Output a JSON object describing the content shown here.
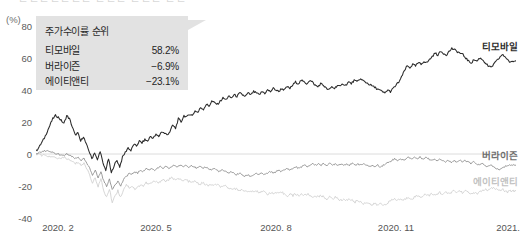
{
  "header": {
    "cropped_text": "ㄴㄴㄴㄴㄴㄴㄴ ㄴㄴㄴ ㄴㄴㄴ ㄴㄴ"
  },
  "axes": {
    "unit_label": "(%)",
    "y_ticks": [
      80,
      60,
      40,
      20,
      0,
      -20,
      -40
    ],
    "y_tick_labels": [
      "80",
      "60",
      "40",
      "20",
      "0",
      "-20",
      "-40"
    ],
    "x_tick_labels": [
      "2020. 2",
      "2020. 5",
      "2020. 8",
      "2020. 11",
      "2021. 2"
    ],
    "ylim": [
      -40,
      80
    ],
    "grid": "zero-line-only"
  },
  "legend": {
    "title": "주가수이률 순위",
    "rows": [
      {
        "name": "티모바일",
        "value": "58.2%"
      },
      {
        "name": "버라이즌",
        "value": "−6.9%"
      },
      {
        "name": "에이티앤티",
        "value": "−23.1%"
      }
    ]
  },
  "series_labels": [
    {
      "text": "티모바일",
      "color": "#2b2b2b"
    },
    {
      "text": "버라이즌",
      "color": "#6d6d6d"
    },
    {
      "text": "에이티앤티",
      "color": "#c2c2c2"
    }
  ],
  "colors": {
    "tmobile": "#2b2b2b",
    "verizon": "#8a8a8a",
    "att": "#cfcfcf",
    "zero_line": "#dcdcdc",
    "legend_bg": "#e2e2e2"
  },
  "chart_data": {
    "type": "line",
    "title": "",
    "subtitle": "",
    "xlabel": "",
    "ylabel": "(%)",
    "ylim": [
      -40,
      80
    ],
    "grid": false,
    "legend_position": "top-left-callout",
    "x_tick_labels": [
      "2020. 2",
      "2020. 5",
      "2020. 8",
      "2020. 11",
      "2021. 2"
    ],
    "x_tick_positions": [
      0,
      0.25,
      0.5,
      0.75,
      1.0
    ],
    "annotations": [
      {
        "text": "주가수이률 순위 티모바일 58.2%",
        "at": "legend"
      },
      {
        "text": "버라이즌 −6.9%",
        "at": "legend"
      },
      {
        "text": "에이티앤티 −23.1%",
        "at": "legend"
      }
    ],
    "series": [
      {
        "name": "티모바일",
        "name_en": "T-Mobile",
        "color": "#2b2b2b",
        "final_value": 58.2,
        "values": [
          2,
          4,
          7,
          10,
          14,
          18,
          22,
          24,
          23,
          21,
          19,
          24,
          22,
          17,
          12,
          13,
          8,
          11,
          6,
          2,
          -3,
          1,
          -4,
          2,
          -6,
          -10,
          -3,
          -12,
          -7,
          -4,
          -8,
          -2,
          1,
          4,
          2,
          6,
          5,
          8,
          7,
          9,
          8,
          11,
          10,
          12,
          11,
          14,
          13,
          12,
          14,
          18,
          16,
          22,
          20,
          24,
          23,
          25,
          24,
          27,
          26,
          29,
          28,
          31,
          30,
          33,
          32,
          31,
          33,
          35,
          34,
          36,
          35,
          37,
          36,
          38,
          37,
          36,
          38,
          37,
          39,
          38,
          37,
          39,
          38,
          40,
          39,
          41,
          40,
          39,
          41,
          40,
          42,
          41,
          43,
          45,
          44,
          46,
          45,
          44,
          46,
          45,
          43,
          42,
          44,
          43,
          41,
          40,
          42,
          41,
          43,
          42,
          44,
          43,
          45,
          44,
          46,
          45,
          47,
          46,
          45,
          44,
          43,
          42,
          41,
          40,
          39,
          38,
          40,
          39,
          41,
          43,
          45,
          48,
          52,
          55,
          54,
          56,
          55,
          57,
          56,
          58,
          57,
          59,
          61,
          63,
          62,
          64,
          63,
          62,
          64,
          66,
          65,
          64,
          63,
          62,
          60,
          58,
          57,
          59,
          58,
          60,
          59,
          57,
          55,
          54,
          56,
          58,
          60,
          62,
          61,
          59,
          57,
          58,
          58.2
        ]
      },
      {
        "name": "버라이즌",
        "name_en": "Verizon",
        "color": "#8a8a8a",
        "final_value": -6.9,
        "values": [
          0,
          1,
          1,
          2,
          2,
          1,
          1,
          0,
          0,
          -1,
          -1,
          0,
          -1,
          -2,
          -3,
          -2,
          -4,
          -3,
          -6,
          -9,
          -13,
          -10,
          -15,
          -11,
          -17,
          -20,
          -16,
          -22,
          -19,
          -17,
          -20,
          -16,
          -14,
          -12,
          -13,
          -11,
          -12,
          -10,
          -11,
          -9,
          -10,
          -9,
          -10,
          -9,
          -8,
          -9,
          -8,
          -9,
          -8,
          -7,
          -8,
          -7,
          -8,
          -7,
          -8,
          -7,
          -8,
          -9,
          -8,
          -9,
          -8,
          -9,
          -10,
          -9,
          -10,
          -11,
          -10,
          -11,
          -12,
          -11,
          -12,
          -13,
          -12,
          -13,
          -14,
          -13,
          -14,
          -13,
          -12,
          -13,
          -12,
          -13,
          -12,
          -11,
          -12,
          -11,
          -10,
          -11,
          -10,
          -9,
          -10,
          -9,
          -8,
          -9,
          -8,
          -7,
          -8,
          -7,
          -6,
          -7,
          -6,
          -7,
          -6,
          -7,
          -6,
          -7,
          -6,
          -7,
          -6,
          -7,
          -6,
          -7,
          -6,
          -7,
          -6,
          -7,
          -6,
          -7,
          -8,
          -7,
          -8,
          -7,
          -8,
          -7,
          -6,
          -5,
          -4,
          -3,
          -4,
          -3,
          -4,
          -3,
          -2,
          -3,
          -2,
          -3,
          -2,
          -3,
          -2,
          -3,
          -4,
          -3,
          -4,
          -3,
          -4,
          -5,
          -4,
          -5,
          -4,
          -5,
          -4,
          -5,
          -4,
          -5,
          -6,
          -5,
          -6,
          -7,
          -6,
          -7,
          -8,
          -7,
          -8,
          -9,
          -10,
          -9,
          -8,
          -7,
          -6.9,
          -7,
          -6.9
        ]
      },
      {
        "name": "에이티앤티",
        "name_en": "AT&T",
        "color": "#cfcfcf",
        "final_value": -23.1,
        "values": [
          0,
          0,
          -1,
          -1,
          -1,
          -2,
          -2,
          -2,
          -3,
          -3,
          -2,
          -3,
          -4,
          -5,
          -6,
          -5,
          -7,
          -6,
          -9,
          -13,
          -18,
          -15,
          -20,
          -16,
          -23,
          -27,
          -22,
          -30,
          -26,
          -23,
          -27,
          -22,
          -19,
          -21,
          -20,
          -22,
          -21,
          -19,
          -20,
          -18,
          -19,
          -18,
          -17,
          -18,
          -17,
          -16,
          -17,
          -16,
          -15,
          -16,
          -15,
          -16,
          -17,
          -16,
          -17,
          -18,
          -17,
          -18,
          -19,
          -18,
          -19,
          -20,
          -19,
          -20,
          -19,
          -20,
          -21,
          -20,
          -21,
          -22,
          -21,
          -22,
          -23,
          -22,
          -23,
          -24,
          -23,
          -24,
          -23,
          -24,
          -23,
          -24,
          -25,
          -24,
          -25,
          -24,
          -25,
          -24,
          -25,
          -26,
          -25,
          -26,
          -25,
          -26,
          -25,
          -26,
          -25,
          -26,
          -27,
          -26,
          -27,
          -26,
          -27,
          -28,
          -27,
          -28,
          -27,
          -28,
          -29,
          -28,
          -29,
          -28,
          -29,
          -30,
          -29,
          -30,
          -31,
          -30,
          -31,
          -32,
          -31,
          -32,
          -31,
          -32,
          -31,
          -30,
          -29,
          -28,
          -29,
          -28,
          -29,
          -28,
          -27,
          -28,
          -27,
          -26,
          -27,
          -26,
          -25,
          -26,
          -25,
          -26,
          -25,
          -24,
          -25,
          -24,
          -25,
          -24,
          -23,
          -24,
          -23,
          -24,
          -23,
          -24,
          -25,
          -24,
          -25,
          -24,
          -23,
          -22,
          -23,
          -22,
          -21,
          -22,
          -23,
          -22,
          -23,
          -24,
          -23.1,
          -23,
          -23.1
        ]
      }
    ]
  }
}
